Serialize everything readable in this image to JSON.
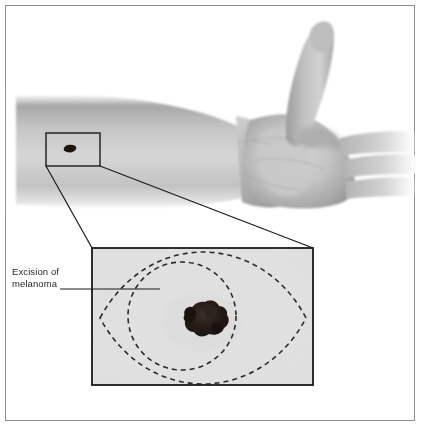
{
  "figure": {
    "domain": "medical-illustration",
    "background_color": "#ffffff",
    "frame": {
      "border_color": "#8d8d8d",
      "border_width_px": 1,
      "x": 5,
      "y": 5,
      "width": 410,
      "height": 416
    }
  },
  "annotations": {
    "excision_label": "Excision of\nmelanoma",
    "excision_label_color": "#2a2a2a",
    "leader_line_color": "#1a1a1a"
  },
  "arm": {
    "description": "Grayscale forearm and hand, palm facing viewer with thumb extended upward, fingers cropped at right edge",
    "skin_light": "#d9d9d9",
    "skin_mid": "#b8b8b8",
    "skin_dark": "#8f8f8f",
    "skin_shadow": "#7a7a7a"
  },
  "callout_box": {
    "label": "magnified-region-on-forearm",
    "x": 46,
    "y": 133,
    "width": 54,
    "height": 33,
    "border_color": "#1a1a1a",
    "border_width_px": 1.4
  },
  "mole_on_arm": {
    "label": "melanoma-lesion-small",
    "cx": 70,
    "cy": 149,
    "rx": 5.5,
    "ry": 3.2,
    "color": "#1c1410"
  },
  "inset_box": {
    "label": "magnified-skin-inset",
    "x": 92,
    "y": 248,
    "width": 221,
    "height": 137,
    "border_color": "#1a1a1a",
    "border_width_px": 1.8,
    "skin_color": "#e6e6e6"
  },
  "excision_outline": {
    "shape": "fusiform-ellipse",
    "style": "dashed",
    "dash_pattern": "5 4",
    "stroke_color": "#2b2b2b",
    "stroke_width_px": 1.6,
    "left_tip_x": 100,
    "right_tip_x": 306,
    "center_y": 318,
    "half_height": 54
  },
  "margin_circle": {
    "shape": "circle",
    "style": "dashed",
    "dash_pattern": "5 4",
    "stroke_color": "#2b2b2b",
    "stroke_width_px": 1.6,
    "cx": 182,
    "cy": 316,
    "r": 54
  },
  "melanoma_inset": {
    "label": "melanoma-lesion-magnified",
    "cx": 201,
    "cy": 322,
    "width": 34,
    "height": 26,
    "color_core": "#221a16",
    "color_edge": "#3b2f28",
    "description": "Irregular asymmetric darkly pigmented lesion with notched borders"
  },
  "connector_lines": {
    "description": "Two leader lines connecting the small callout box on the forearm to the magnified inset box",
    "color": "#1a1a1a",
    "width_px": 1.2,
    "upper": {
      "x1": 100,
      "y1": 166,
      "x2": 313,
      "y2": 248
    },
    "lower": {
      "x1": 46,
      "y1": 166,
      "x2": 92,
      "y2": 248
    }
  },
  "label_leader": {
    "description": "Horizontal line from the melanoma text label to the inset excision outline",
    "x1": 60,
    "y1": 289,
    "x2": 160,
    "y2": 289,
    "color": "#1a1a1a",
    "width_px": 1.1
  }
}
